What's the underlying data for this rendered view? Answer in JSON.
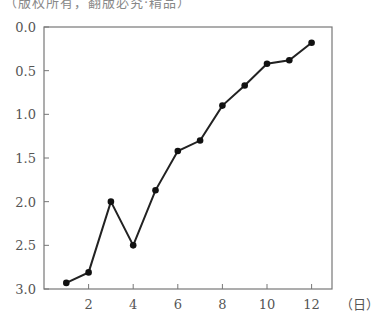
{
  "caption": "（版权所有，翻版必究·精品）",
  "chart_data": {
    "type": "line",
    "title": "",
    "xlabel": "（日）",
    "ylabel": "",
    "x": [
      1,
      2,
      3,
      4,
      5,
      6,
      7,
      8,
      9,
      10,
      11,
      12
    ],
    "series": [
      {
        "name": "",
        "values": [
          2.93,
          2.81,
          2.0,
          2.5,
          1.87,
          1.42,
          1.3,
          0.9,
          0.67,
          0.42,
          0.38,
          0.18
        ]
      }
    ],
    "xticks": [
      "2",
      "4",
      "6",
      "8",
      "10",
      "12"
    ],
    "yticks": [
      "0.0",
      "0.5",
      "1.0",
      "1.5",
      "2.0",
      "2.5",
      "3.0"
    ],
    "ylim": [
      0.0,
      3.0
    ],
    "y_inverted": true,
    "xlim": [
      0,
      12.8
    ],
    "grid": false,
    "legend": "none"
  }
}
